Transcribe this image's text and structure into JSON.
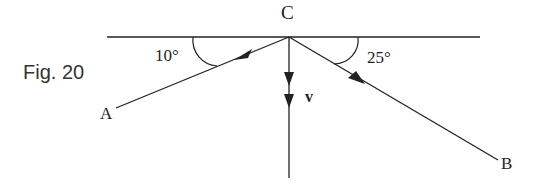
{
  "figure": {
    "caption": "Fig. 20"
  },
  "points": {
    "C": "C",
    "A": "A",
    "B": "B"
  },
  "angles": {
    "left": "10°",
    "right": "25°"
  },
  "vector": {
    "label": "v"
  },
  "colors": {
    "line": "#222222",
    "background": "#ffffff"
  }
}
